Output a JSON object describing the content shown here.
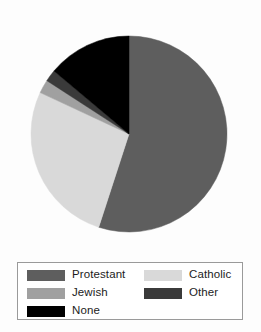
{
  "chart_data": {
    "type": "pie",
    "title": "",
    "subtitle": "",
    "xlabel": "",
    "ylabel": "",
    "grid": false,
    "legend_position": "bottom",
    "start_angle_deg": 0,
    "direction": "clockwise",
    "center": {
      "x": 129,
      "y": 134
    },
    "radius": 98,
    "categories": [
      "Protestant",
      "Catholic",
      "Jewish",
      "Other",
      "None"
    ],
    "values": [
      55,
      27,
      2,
      2,
      14
    ],
    "units": "percent",
    "slices": [
      {
        "label": "Protestant",
        "value": 55,
        "color": "#5e5e5e",
        "start_deg": 0,
        "end_deg": 198
      },
      {
        "label": "Catholic",
        "value": 27,
        "color": "#d9d9d9",
        "start_deg": 198,
        "end_deg": 295
      },
      {
        "label": "Jewish",
        "value": 2,
        "color": "#a0a0a0",
        "start_deg": 295,
        "end_deg": 303
      },
      {
        "label": "Other",
        "value": 2,
        "color": "#3a3a3a",
        "start_deg": 303,
        "end_deg": 310
      },
      {
        "label": "None",
        "value": 14,
        "color": "#000000",
        "start_deg": 310,
        "end_deg": 360
      }
    ]
  },
  "legend": {
    "entries": [
      {
        "label": "Protestant",
        "color": "#5e5e5e",
        "swatch_name": "legend-swatch-protestant"
      },
      {
        "label": "Catholic",
        "color": "#d9d9d9",
        "swatch_name": "legend-swatch-catholic"
      },
      {
        "label": "Jewish",
        "color": "#a0a0a0",
        "swatch_name": "legend-swatch-jewish"
      },
      {
        "label": "Other",
        "color": "#3a3a3a",
        "swatch_name": "legend-swatch-other"
      },
      {
        "label": "None",
        "color": "#000000",
        "swatch_name": "legend-swatch-none"
      }
    ]
  },
  "colors": {
    "protestant": "#5e5e5e",
    "catholic": "#d9d9d9",
    "jewish": "#a0a0a0",
    "other": "#3a3a3a",
    "none": "#000000",
    "legend_border": "#9a9a9a",
    "background": "#fdfdfd"
  }
}
